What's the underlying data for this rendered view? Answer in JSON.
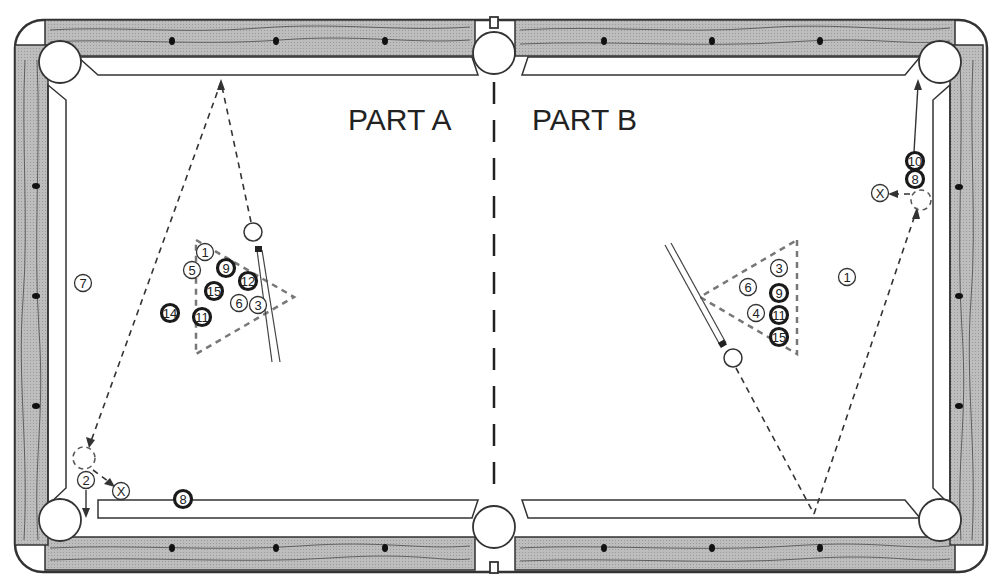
{
  "diagram": {
    "type": "pool-table-shot-diagram",
    "labels": {
      "part_a": "PART A",
      "part_b": "PART B"
    },
    "colors": {
      "rail_wood": "#b8b8b8",
      "rail_grain": "#555555",
      "cloth": "#ffffff",
      "line": "#333333",
      "dash": "#555555",
      "solid_ball_ring": "#222222"
    },
    "part_a": {
      "cue_ball": {
        "x": 253,
        "y": 232
      },
      "rack_triangle": [
        [
          196,
          240
        ],
        [
          294,
          297
        ],
        [
          196,
          354
        ]
      ],
      "balls": [
        {
          "n": "1",
          "x": 205,
          "y": 252,
          "dark": false
        },
        {
          "n": "5",
          "x": 192,
          "y": 270,
          "dark": false
        },
        {
          "n": "9",
          "x": 226,
          "y": 268,
          "dark": true
        },
        {
          "n": "12",
          "x": 248,
          "y": 281,
          "dark": true
        },
        {
          "n": "15",
          "x": 214,
          "y": 291,
          "dark": true
        },
        {
          "n": "6",
          "x": 239,
          "y": 303,
          "dark": false
        },
        {
          "n": "3",
          "x": 258,
          "y": 305,
          "dark": false
        },
        {
          "n": "14",
          "x": 170,
          "y": 313,
          "dark": true
        },
        {
          "n": "11",
          "x": 202,
          "y": 317,
          "dark": true
        },
        {
          "n": "7",
          "x": 83,
          "y": 283,
          "dark": false
        },
        {
          "n": "2",
          "x": 86,
          "y": 480,
          "dark": false
        },
        {
          "n": "8",
          "x": 183,
          "y": 499,
          "dark": true
        },
        {
          "n": "X",
          "x": 121,
          "y": 491,
          "dark": false
        }
      ],
      "ghost_ball": {
        "x": 84,
        "y": 458
      }
    },
    "part_b": {
      "cue_ball": {
        "x": 733,
        "y": 358
      },
      "rack_triangle": [
        [
          797,
          240
        ],
        [
          797,
          354
        ],
        [
          700,
          297
        ]
      ],
      "balls": [
        {
          "n": "3",
          "x": 779,
          "y": 268,
          "dark": false
        },
        {
          "n": "6",
          "x": 748,
          "y": 287,
          "dark": false
        },
        {
          "n": "9",
          "x": 779,
          "y": 293,
          "dark": true
        },
        {
          "n": "4",
          "x": 756,
          "y": 313,
          "dark": false
        },
        {
          "n": "11",
          "x": 779,
          "y": 315,
          "dark": true
        },
        {
          "n": "15",
          "x": 779,
          "y": 337,
          "dark": true
        },
        {
          "n": "1",
          "x": 847,
          "y": 277,
          "dark": false
        },
        {
          "n": "10",
          "x": 915,
          "y": 161,
          "dark": true
        },
        {
          "n": "8",
          "x": 915,
          "y": 179,
          "dark": true
        },
        {
          "n": "X",
          "x": 880,
          "y": 193,
          "dark": false
        }
      ],
      "ghost_ball": {
        "x": 920,
        "y": 200
      }
    }
  }
}
